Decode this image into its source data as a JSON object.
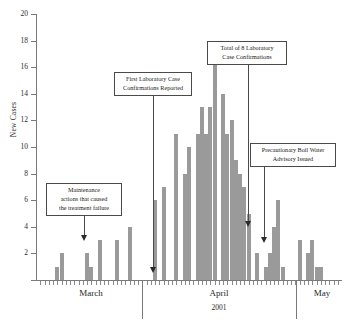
{
  "chart_data": {
    "type": "bar",
    "title": "",
    "xlabel": "2001",
    "ylabel": "New Cases",
    "ylim": [
      0,
      20
    ],
    "ytick_step": 2,
    "yticks": [
      0,
      2,
      4,
      6,
      8,
      10,
      12,
      14,
      16,
      18,
      20
    ],
    "grid": false,
    "legend": "none",
    "bar_color": "#9a9a9a",
    "month_labels": [
      "March",
      "April",
      "May"
    ],
    "year_label": "2001",
    "categories": [
      "Mar 1",
      "Mar 2",
      "Mar 3",
      "Mar 4",
      "Mar 5",
      "Mar 6",
      "Mar 7",
      "Mar 8",
      "Mar 9",
      "Mar 10",
      "Mar 11",
      "Mar 12",
      "Mar 13",
      "Mar 14",
      "Mar 15",
      "Mar 16",
      "Mar 17",
      "Mar 18",
      "Mar 19",
      "Mar 20",
      "Mar 21",
      "Mar 22",
      "Mar 23",
      "Mar 24",
      "Mar 25",
      "Mar 26",
      "Mar 27",
      "Mar 28",
      "Mar 29",
      "Mar 30",
      "Mar 31",
      "Apr 1",
      "Apr 2",
      "Apr 3",
      "Apr 4",
      "Apr 5",
      "Apr 6",
      "Apr 7",
      "Apr 8",
      "Apr 9",
      "Apr 10",
      "Apr 11",
      "Apr 12",
      "Apr 13",
      "Apr 14",
      "Apr 15",
      "Apr 16",
      "Apr 17",
      "Apr 18",
      "Apr 19",
      "Apr 20",
      "Apr 21",
      "Apr 22",
      "Apr 23",
      "Apr 24",
      "Apr 25",
      "Apr 26",
      "Apr 27",
      "Apr 28",
      "Apr 29",
      "Apr 30",
      "May 1",
      "May 2",
      "May 3",
      "May 4",
      "May 5",
      "May 6",
      "May 7",
      "May 8",
      "May 9",
      "May 10"
    ],
    "values": [
      0,
      0,
      0,
      0,
      1,
      2,
      0,
      0,
      0,
      0,
      0,
      2,
      1,
      0,
      3,
      0,
      0,
      0,
      3,
      0,
      0,
      4,
      0,
      0,
      0,
      0,
      0,
      6,
      0,
      7,
      0,
      0,
      11,
      0,
      8,
      10,
      0,
      11,
      13,
      11,
      13,
      18,
      0,
      14,
      11,
      12,
      9,
      8,
      7,
      5,
      0,
      2,
      0,
      1,
      2,
      4,
      6,
      1,
      0,
      0,
      0,
      3,
      0,
      2,
      3,
      1,
      1,
      0,
      0,
      0,
      0
    ]
  },
  "annotations": {
    "maintenance": {
      "line1": "Maintenance",
      "line2": "actions that caused",
      "line3": "the treatment failure"
    },
    "first_confirmation": {
      "line1": "First Laboratory Case",
      "line2": "Confirmations Reported"
    },
    "total_confirmations": {
      "line1": "Total of 8 Laboratory",
      "line2": "Case Confirmations"
    },
    "boil_water": {
      "line1": "Precautionary Boil Water",
      "line2": "Advisory Issued"
    }
  }
}
